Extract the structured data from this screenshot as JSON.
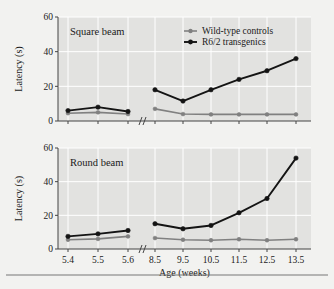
{
  "figure": {
    "background_color": "#f2f2f0",
    "panel_color": "#e2e2e0",
    "bottom_rule": true
  },
  "axis": {
    "xlabel": "Age (weeks)",
    "ylabel_top": "Latency (s)",
    "ylabel_bottom": "Latency (s)",
    "x_tick_labels": [
      "5.4",
      "5.5",
      "5.6",
      "8.5",
      "9.5",
      "10.5",
      "11.5",
      "12.5",
      "13.5"
    ],
    "y_tick_labels": [
      "0",
      "20",
      "40",
      "60"
    ],
    "axis_break_symbol": "//"
  },
  "legend": {
    "position": "top-right-of-upper-panel",
    "entries": [
      {
        "label": "Wild-type controls",
        "color": "#808080",
        "marker": "diamond"
      },
      {
        "label": "R6/2 transgenics",
        "color": "#141414",
        "marker": "diamond"
      }
    ]
  },
  "chart_data": [
    {
      "type": "line",
      "title": "Square beam",
      "xlabel": "Age (weeks)",
      "ylabel": "Latency (s)",
      "x": [
        5.4,
        5.5,
        5.6,
        8.5,
        9.5,
        10.5,
        11.5,
        12.5,
        13.5
      ],
      "xtick_labels": [
        "5.4",
        "5.5",
        "5.6",
        "8.5",
        "9.5",
        "10.5",
        "11.5",
        "12.5",
        "13.5"
      ],
      "ylim": [
        0,
        60
      ],
      "yticks": [
        0,
        20,
        40,
        60
      ],
      "axis_break_after_index": 2,
      "grid": true,
      "series": [
        {
          "name": "Wild-type controls",
          "color": "#808080",
          "values": [
            4.5,
            5.0,
            4.0,
            7.0,
            4.0,
            3.8,
            3.8,
            3.8,
            3.8
          ]
        },
        {
          "name": "R6/2 transgenics",
          "color": "#141414",
          "values": [
            6.0,
            8.0,
            5.5,
            18.0,
            11.5,
            18.0,
            24.0,
            29.0,
            36.0
          ]
        }
      ]
    },
    {
      "type": "line",
      "title": "Round beam",
      "xlabel": "Age (weeks)",
      "ylabel": "Latency (s)",
      "x": [
        5.4,
        5.5,
        5.6,
        8.5,
        9.5,
        10.5,
        11.5,
        12.5,
        13.5
      ],
      "xtick_labels": [
        "5.4",
        "5.5",
        "5.6",
        "8.5",
        "9.5",
        "10.5",
        "11.5",
        "12.5",
        "13.5"
      ],
      "ylim": [
        0,
        60
      ],
      "yticks": [
        0,
        20,
        40,
        60
      ],
      "axis_break_after_index": 2,
      "grid": true,
      "series": [
        {
          "name": "Wild-type controls",
          "color": "#808080",
          "values": [
            5.5,
            6.0,
            7.5,
            6.5,
            5.5,
            5.2,
            5.8,
            5.2,
            5.8
          ]
        },
        {
          "name": "R6/2 transgenics",
          "color": "#141414",
          "values": [
            7.5,
            9.0,
            11.0,
            15.0,
            12.0,
            14.0,
            21.5,
            30.0,
            54.0
          ]
        }
      ]
    }
  ]
}
